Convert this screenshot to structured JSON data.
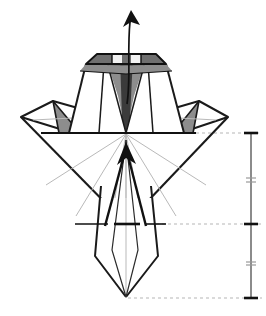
{
  "figure": {
    "kind": "origami-step-diagram",
    "canvas": {
      "width": 266,
      "height": 316,
      "background": "#ffffff"
    }
  },
  "colors": {
    "outline": "#1a1a1a",
    "outline_secondary": "#2b2b2b",
    "crease_light": "#b9b9b9",
    "shade_dark": "#6f6f6f",
    "shade_mid": "#8d8d8d",
    "shade_light": "#a8a8a8",
    "reference_dash": "#b5b5b5",
    "scale_line": "#5a5a5a",
    "paper_white": "#ffffff"
  },
  "geometry": {
    "center_x": 126,
    "horizon_y": 133,
    "mid_fold_y": 224,
    "bottom_tip_y": 298,
    "apex_y": 54,
    "left_tip_x": 21,
    "right_tip_x": 228
  },
  "shapes": {
    "top_trapezoid": {
      "name": "top-body-trapezoid",
      "points": "69,133 86,64 166,64 184,133"
    },
    "top_cap": {
      "name": "top-cap-band",
      "points": "86,64 97,54 156,54 166,64"
    },
    "left_cap_shade": {
      "name": "top-cap-left-shade",
      "points": "86,64 97,54 126,54 126,65"
    },
    "right_cap_shade": {
      "name": "top-cap-right-shade",
      "points": "126,54 156,54 166,64 126,65"
    },
    "cap_left_bevel": {
      "name": "cap-left-bevel-shade",
      "points": "86,64 126,65 126,72 82,70"
    },
    "cap_right_bevel": {
      "name": "cap-right-bevel-shade",
      "points": "126,65 166,64 171,70 126,72"
    },
    "center_spike_left": {
      "name": "center-spike-left-shade",
      "points": "110,63 126,63 126,133 119,95"
    },
    "center_spike_right": {
      "name": "center-spike-right-shade",
      "points": "126,63 142,63 133,95 126,133"
    },
    "center_spike_core": {
      "name": "center-spike-core",
      "points": "120,55 132,55 129,120 126,133 123,120"
    },
    "body_panel_left": {
      "name": "body-panel-left",
      "points": "69,133 86,64 104,64 100,133"
    },
    "body_panel_right": {
      "name": "body-panel-right",
      "points": "184,133 166,64 148,64 152,133"
    },
    "left_wing_diamond": {
      "name": "left-wing-diamond",
      "points": "21,117 53,101 90,110 73,133"
    },
    "right_wing_diamond": {
      "name": "right-wing-diamond",
      "points": "228,117 199,101 163,110 180,133"
    },
    "left_wing_shade": {
      "name": "left-wing-shade-triangle",
      "points": "53,101 80,133 59,133"
    },
    "right_wing_shade": {
      "name": "right-wing-shade-triangle",
      "points": "199,101 173,133 193,133"
    },
    "big_diamond_left": {
      "name": "lower-diamond-left-edge",
      "points": "21,117 126,224"
    },
    "big_diamond_right": {
      "name": "lower-diamond-right-edge",
      "points": "228,117 126,224"
    },
    "tail": {
      "name": "tail-panel",
      "points": "100,200 95,257 126,298 158,257 152,200"
    }
  },
  "arrows": {
    "top_arrow": {
      "name": "unfold-arrow-up",
      "label": "pull up",
      "path": "M 128,103 C 131,80 128,52 131,22",
      "head": "131,10 124,27 140,25"
    },
    "center_arrow": {
      "name": "fold-arrow-up-center",
      "label": "fold up",
      "path": "M 126,185 L 126,147",
      "head": "126,143 117,163 135,161"
    }
  },
  "reference_lines": {
    "top_dashed": {
      "name": "reference-line-top",
      "y": 133,
      "x1": 184,
      "x2": 262,
      "style": "dashed"
    },
    "mid_dashed": {
      "name": "reference-line-mid",
      "y": 224,
      "x1": 138,
      "x2": 262,
      "style": "dashed"
    },
    "mid_solid_dash": {
      "name": "crease-mark-mid",
      "y": 224,
      "x1": 75,
      "x2": 138,
      "style": "dash-heavy"
    },
    "bottom_dashed": {
      "name": "reference-line-bottom",
      "y": 298,
      "x1": 128,
      "x2": 262,
      "style": "dashed"
    }
  },
  "scale": {
    "name": "measurement-scale",
    "x": 251,
    "top_y": 133,
    "bottom_y": 298,
    "ticks": [
      {
        "name": "scale-tick-top",
        "y": 133,
        "weight": "heavy"
      },
      {
        "name": "scale-tick-quarter",
        "y": 178,
        "weight": "light"
      },
      {
        "name": "scale-tick-middle",
        "y": 224,
        "weight": "heavy"
      },
      {
        "name": "scale-tick-three-quarter",
        "y": 262,
        "weight": "light"
      },
      {
        "name": "scale-tick-bottom",
        "y": 298,
        "weight": "heavy"
      }
    ]
  },
  "creases": {
    "radial_from_center": [
      {
        "name": "crease-radial-1",
        "path": "M 126,134 L 46,185"
      },
      {
        "name": "crease-radial-2",
        "path": "M 126,134 L 76,214"
      },
      {
        "name": "crease-radial-3",
        "path": "M 126,134 L 108,224"
      },
      {
        "name": "crease-radial-4",
        "path": "M 126,134 L 144,224"
      },
      {
        "name": "crease-radial-5",
        "path": "M 126,134 L 176,214"
      },
      {
        "name": "crease-radial-6",
        "path": "M 126,134 L 206,185"
      }
    ],
    "tail_center": {
      "name": "crease-tail-center",
      "path": "M 126,134 L 126,298"
    },
    "wing_left": {
      "name": "crease-wing-left",
      "path": "M 33,120 L 90,118"
    },
    "wing_right": {
      "name": "crease-wing-right",
      "path": "M 216,120 L 163,118"
    },
    "cap_inner_left": {
      "name": "crease-cap-inner-left",
      "path": "M 104,55 L 104,64"
    },
    "cap_inner_right": {
      "name": "crease-cap-inner-right",
      "path": "M 148,55 L 148,64"
    }
  }
}
